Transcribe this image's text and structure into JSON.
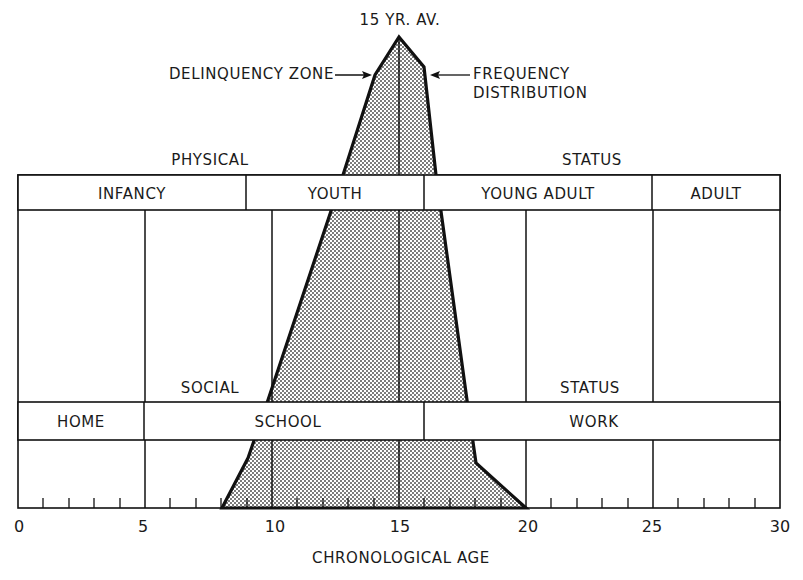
{
  "title_label": "15 YR. AV.",
  "annotations": {
    "delinquency_zone": "DELINQUENCY ZONE",
    "frequency_line1": "FREQUENCY",
    "frequency_line2": "DISTRIBUTION"
  },
  "physical_band": {
    "label_left": "PHYSICAL",
    "label_right": "STATUS",
    "segments": [
      {
        "label": "INFANCY",
        "from_age": 0,
        "to_age": 9
      },
      {
        "label": "YOUTH",
        "from_age": 9,
        "to_age": 16
      },
      {
        "label": "YOUNG ADULT",
        "from_age": 16,
        "to_age": 25
      },
      {
        "label": "ADULT",
        "from_age": 25,
        "to_age": 30
      }
    ]
  },
  "social_band": {
    "label_left": "SOCIAL",
    "label_right": "STATUS",
    "segments": [
      {
        "label": "HOME",
        "from_age": 0,
        "to_age": 5
      },
      {
        "label": "SCHOOL",
        "from_age": 5,
        "to_age": 16
      },
      {
        "label": "WORK",
        "from_age": 16,
        "to_age": 30
      }
    ]
  },
  "x_axis": {
    "label": "CHRONOLOGICAL AGE",
    "ticks": [
      "0",
      "5",
      "10",
      "15",
      "20",
      "25",
      "30"
    ],
    "min": 0,
    "max": 30,
    "minor_tick_step": 1
  },
  "frequency_distribution": {
    "peak_age": 15,
    "start_age": 8,
    "end_age": 20,
    "fill": "stippled gray"
  },
  "colors": {
    "line": "#111111",
    "background": "#ffffff",
    "stipple": "#555555"
  }
}
